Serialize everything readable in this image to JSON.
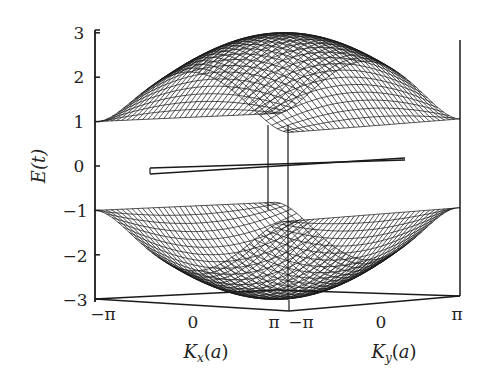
{
  "chart_data": {
    "type": "surface-wireframe",
    "title": "",
    "xlabel": "Kx(a)",
    "xlabel_main": "K",
    "xlabel_sub": "x",
    "xlabel_tail": "(a)",
    "ylabel2": "Ky(a)",
    "ylabel2_main": "K",
    "ylabel2_sub": "y",
    "ylabel2_tail": "(a)",
    "zlabel": "E(t)",
    "zlim": [
      -3,
      3
    ],
    "z_ticks": [
      "3",
      "2",
      "1",
      "0",
      "−1",
      "−2",
      "−3"
    ],
    "z_tick_values": [
      3,
      2,
      1,
      0,
      -1,
      -2,
      -3
    ],
    "kx_ticks": [
      "−π",
      "0",
      "π"
    ],
    "ky_ticks": [
      "−π",
      "0",
      "π"
    ],
    "kx_range": [
      "-pi",
      "pi"
    ],
    "ky_range": [
      "-pi",
      "pi"
    ],
    "bands": [
      {
        "name": "conduction band",
        "max": 3,
        "min": 0
      },
      {
        "name": "valence band",
        "max": 0,
        "min": -3
      }
    ],
    "grid": false,
    "line_color": "#1a1a1a",
    "background": "#ffffff"
  }
}
